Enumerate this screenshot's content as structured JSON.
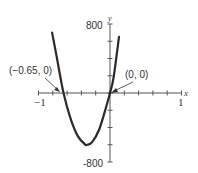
{
  "chart_data": {
    "type": "line",
    "title": "",
    "xlabel": "x",
    "ylabel": "y",
    "xlim": [
      -1,
      1
    ],
    "ylim": [
      -800,
      800
    ],
    "x_ticks_step": 0.2,
    "y_ticks_step": 200,
    "x_tick_labels": [
      "-1",
      "1"
    ],
    "y_tick_labels": [
      "800",
      "-800"
    ],
    "grid": false,
    "series": [
      {
        "name": "f(x)",
        "x": [
          -0.81,
          -0.75,
          -0.65,
          -0.55,
          -0.45,
          -0.35,
          -0.32,
          -0.25,
          -0.15,
          -0.05,
          0,
          0.05,
          0.126
        ],
        "y": [
          700,
          440,
          0,
          -300,
          -500,
          -595,
          -600,
          -570,
          -420,
          -150,
          0,
          180,
          650
        ]
      }
    ],
    "annotations": [
      {
        "text": "(−0.65, 0)",
        "x": -0.65,
        "y": 0
      },
      {
        "text": "(0, 0)",
        "x": 0,
        "y": 0
      }
    ]
  },
  "axis": {
    "x_label": "x",
    "y_label": "y",
    "x_min_label": "−1",
    "x_max_label": "1",
    "y_max_label": "800",
    "y_min_label": "-800"
  },
  "annotations": {
    "left_root": "(−0.65, 0)",
    "origin": "(0, 0)"
  },
  "colors": {
    "curve": "#2a2a2a",
    "axis": "#555555"
  }
}
